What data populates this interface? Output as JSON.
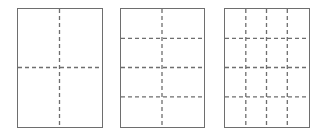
{
  "diagram": {
    "line_color": "#6e6e6e",
    "border_color": "#6e6e6e",
    "panels": [
      {
        "id": "panel-1",
        "columns": 2,
        "rows": 2,
        "x": 17,
        "y": 8,
        "w": 86,
        "h": 120
      },
      {
        "id": "panel-2",
        "columns": 2,
        "rows": 4,
        "x": 120,
        "y": 8,
        "w": 85,
        "h": 120
      },
      {
        "id": "panel-3",
        "columns": 4,
        "rows": 4,
        "x": 224,
        "y": 8,
        "w": 86,
        "h": 120
      }
    ]
  }
}
